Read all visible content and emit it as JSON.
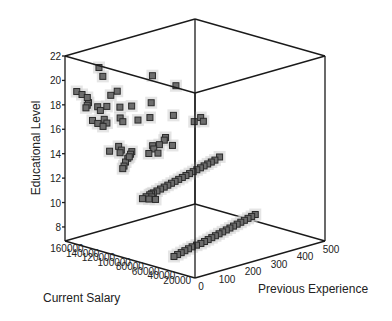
{
  "chart_data": {
    "type": "scatter3d",
    "title": "",
    "axes": {
      "z": {
        "label": "Educational Level",
        "ticks": [
          8,
          10,
          12,
          14,
          16,
          18,
          20,
          22
        ],
        "range": [
          6.85,
          22
        ]
      },
      "x": {
        "label": "Current Salary",
        "ticks": [
          160000,
          140000,
          120000,
          100000,
          80000,
          60000,
          40000,
          20000
        ],
        "range": [
          0,
          165000
        ]
      },
      "y": {
        "label": "Previous Experience",
        "ticks": [
          0,
          100,
          200,
          300,
          400,
          500
        ],
        "range": [
          0,
          500
        ]
      }
    },
    "marker": "square",
    "points": [
      [
        30000,
        10,
        8
      ],
      [
        32000,
        30,
        8
      ],
      [
        34000,
        50,
        8
      ],
      [
        36000,
        70,
        8
      ],
      [
        38000,
        90,
        8
      ],
      [
        40000,
        110,
        8
      ],
      [
        41000,
        130,
        8
      ],
      [
        42000,
        150,
        8
      ],
      [
        44000,
        170,
        8
      ],
      [
        46000,
        190,
        8
      ],
      [
        48000,
        210,
        8
      ],
      [
        50000,
        230,
        8
      ],
      [
        52000,
        250,
        8
      ],
      [
        54000,
        270,
        8
      ],
      [
        56000,
        290,
        8
      ],
      [
        58000,
        310,
        8
      ],
      [
        60000,
        330,
        8
      ],
      [
        62000,
        350,
        8
      ],
      [
        64000,
        370,
        8
      ],
      [
        66000,
        390,
        8
      ],
      [
        68000,
        410,
        8
      ],
      [
        70000,
        430,
        8
      ],
      [
        72000,
        450,
        8
      ],
      [
        70000,
        10,
        12
      ],
      [
        72000,
        30,
        12
      ],
      [
        74000,
        50,
        12
      ],
      [
        76000,
        70,
        12
      ],
      [
        78000,
        90,
        12
      ],
      [
        80000,
        110,
        12
      ],
      [
        82000,
        130,
        12
      ],
      [
        84000,
        150,
        12
      ],
      [
        86000,
        170,
        12
      ],
      [
        88000,
        190,
        12
      ],
      [
        90000,
        210,
        12
      ],
      [
        92000,
        230,
        12
      ],
      [
        94000,
        250,
        12
      ],
      [
        96000,
        270,
        12
      ],
      [
        98000,
        290,
        12
      ],
      [
        100000,
        310,
        12
      ],
      [
        102000,
        330,
        12
      ],
      [
        104000,
        350,
        12
      ],
      [
        106000,
        370,
        12
      ],
      [
        108000,
        390,
        12
      ],
      [
        110000,
        410,
        12
      ],
      [
        114000,
        440,
        12
      ],
      [
        65000,
        20,
        12
      ],
      [
        68000,
        40,
        12
      ],
      [
        75000,
        60,
        12
      ],
      [
        60000,
        30,
        12
      ],
      [
        90000,
        20,
        15
      ],
      [
        95000,
        40,
        15
      ],
      [
        100000,
        60,
        15
      ],
      [
        105000,
        30,
        15
      ],
      [
        85000,
        80,
        15
      ],
      [
        110000,
        50,
        15
      ],
      [
        115000,
        20,
        15
      ],
      [
        80000,
        100,
        15
      ],
      [
        92000,
        120,
        15
      ],
      [
        120000,
        70,
        15
      ],
      [
        100000,
        140,
        15
      ],
      [
        98000,
        160,
        15
      ],
      [
        88000,
        180,
        15
      ],
      [
        105000,
        200,
        15
      ],
      [
        110000,
        220,
        15
      ],
      [
        95000,
        10,
        14
      ],
      [
        100000,
        30,
        14
      ],
      [
        108000,
        60,
        14
      ],
      [
        115000,
        90,
        14
      ],
      [
        120000,
        10,
        17
      ],
      [
        125000,
        40,
        17
      ],
      [
        130000,
        20,
        17
      ],
      [
        135000,
        60,
        17
      ],
      [
        118000,
        80,
        17
      ],
      [
        128000,
        100,
        17
      ],
      [
        140000,
        30,
        17
      ],
      [
        112000,
        120,
        17
      ],
      [
        110000,
        160,
        17
      ],
      [
        100000,
        220,
        17
      ],
      [
        130000,
        30,
        18
      ],
      [
        140000,
        50,
        18
      ],
      [
        145000,
        20,
        18
      ],
      [
        150000,
        40,
        18
      ],
      [
        135000,
        70,
        18
      ],
      [
        125000,
        90,
        18
      ],
      [
        120000,
        120,
        18
      ],
      [
        115000,
        180,
        18
      ],
      [
        155000,
        60,
        18
      ],
      [
        140000,
        10,
        19
      ],
      [
        150000,
        20,
        19
      ],
      [
        130000,
        70,
        19
      ],
      [
        160000,
        30,
        19
      ],
      [
        135000,
        110,
        19
      ],
      [
        110000,
        260,
        19
      ],
      [
        150000,
        100,
        20
      ],
      [
        120000,
        200,
        20
      ],
      [
        145000,
        70,
        21
      ],
      [
        100000,
        300,
        16
      ],
      [
        95000,
        320,
        16
      ],
      [
        105000,
        340,
        16
      ]
    ]
  }
}
